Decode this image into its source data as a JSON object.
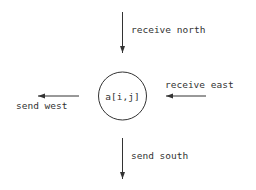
{
  "diagram": {
    "node": {
      "label": "a[i,j]"
    },
    "labels": {
      "receive_north": "receive north",
      "receive_east": "receive east",
      "send_west": "send west",
      "send_south": "send south"
    },
    "colors": {
      "stroke": "#333333",
      "background": "#ffffff"
    }
  }
}
